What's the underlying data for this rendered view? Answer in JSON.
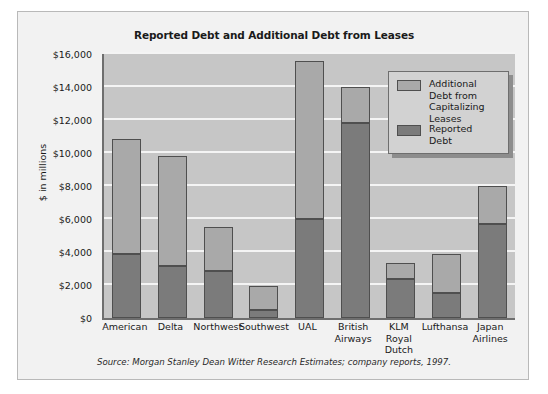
{
  "figure": {
    "source_note": "Source: Morgan Stanley Dean Witter Research Estimates; company reports, 1997."
  },
  "colors": {
    "additional_debt": "#a9a9a9",
    "reported_debt": "#7b7b7b",
    "plot_background": "#c6c6c6",
    "panel_background": "#f2f2f2",
    "gridline": "#f4f4f4",
    "axis": "#6e6e6e",
    "legend_background": "#d2d2d2",
    "text": "#1a1a1a"
  },
  "legend": {
    "position": "inside-top-right",
    "entries": [
      {
        "label": "Additional\nDebt from\nCapitalizing\nLeases",
        "color": "#a9a9a9"
      },
      {
        "label": "Reported\nDebt",
        "color": "#7b7b7b"
      }
    ]
  },
  "chart_data": {
    "type": "bar",
    "stacked": true,
    "title": "Reported Debt and Additional Debt from Leases",
    "xlabel": "",
    "ylabel": "$ in millions",
    "ylim": [
      0,
      16000
    ],
    "ytick_step": 2000,
    "ytick_labels": [
      "$0",
      "$2,000",
      "$4,000",
      "$6,000",
      "$8,000",
      "$10,000",
      "$12,000",
      "$14,000",
      "$16,000"
    ],
    "ytick_values": [
      0,
      2000,
      4000,
      6000,
      8000,
      10000,
      12000,
      14000,
      16000
    ],
    "grid": true,
    "categories": [
      "American",
      "Delta",
      "Northwest",
      "Southwest",
      "UAL",
      "British Airways",
      "KLM Royal Dutch",
      "Lufthansa",
      "Japan Airlines"
    ],
    "series": [
      {
        "name": "Reported Debt",
        "color": "#7b7b7b",
        "values": [
          3900,
          3150,
          2850,
          500,
          6000,
          11800,
          2350,
          1500,
          5700
        ]
      },
      {
        "name": "Additional Debt from Capitalizing Leases",
        "color": "#a9a9a9",
        "values": [
          6900,
          6600,
          2600,
          1400,
          9500,
          2150,
          900,
          2300,
          2250
        ]
      }
    ],
    "totals": [
      10800,
      9750,
      5450,
      1900,
      15500,
      13950,
      3250,
      3800,
      7950
    ]
  }
}
